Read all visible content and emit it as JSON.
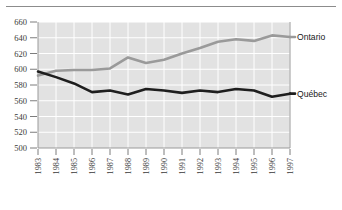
{
  "chart_data": {
    "type": "line",
    "title": "",
    "xlabel": "",
    "ylabel": "",
    "ylim": [
      500,
      660
    ],
    "yticks": [
      500,
      520,
      540,
      560,
      580,
      600,
      620,
      640,
      660
    ],
    "grid": true,
    "legend_position": "right-inline",
    "categories": [
      "1983",
      "1984",
      "1985",
      "1986",
      "1987",
      "1988",
      "1989",
      "1990",
      "1991",
      "1992",
      "1993",
      "1994",
      "1995",
      "1996",
      "1997"
    ],
    "series": [
      {
        "name": "Ontario",
        "color": "#9a9a9a",
        "values": [
          592,
          598,
          599,
          599,
          601,
          615,
          608,
          612,
          620,
          627,
          635,
          638,
          636,
          643,
          641
        ]
      },
      {
        "name": "Québec",
        "color": "#1e1e1e",
        "values": [
          597,
          590,
          582,
          571,
          573,
          568,
          575,
          573,
          570,
          573,
          571,
          575,
          573,
          565,
          569
        ]
      }
    ]
  },
  "axes": {
    "y_tick_labels": [
      "660",
      "640",
      "620",
      "600",
      "580",
      "560",
      "540",
      "520",
      "500"
    ],
    "x_tick_labels": [
      "1983",
      "1984",
      "1985",
      "1986",
      "1987",
      "1988",
      "1989",
      "1990",
      "1991",
      "1992",
      "1993",
      "1994",
      "1995",
      "1996",
      "1997"
    ]
  },
  "legend": {
    "ontario_label": "Ontario",
    "quebec_label": "Québec"
  },
  "colors": {
    "plot_background": "#e2e2e2",
    "gridline": "#ffffff",
    "ontario": "#9a9a9a",
    "quebec": "#1e1e1e",
    "axis": "#9a9a9a",
    "rule": "#8c8c8c"
  }
}
